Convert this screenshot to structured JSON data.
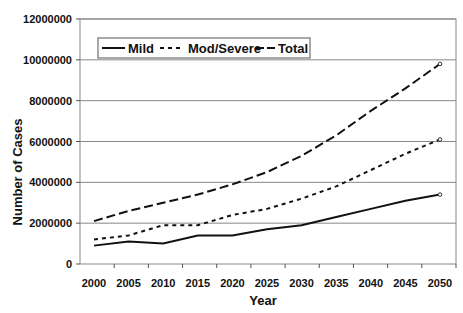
{
  "chart_data": {
    "type": "line",
    "title": "",
    "xlabel": "Year",
    "ylabel": "Number of Cases",
    "x": [
      2000,
      2005,
      2010,
      2015,
      2020,
      2025,
      2030,
      2035,
      2040,
      2045,
      2050
    ],
    "ylim": [
      0,
      12000000
    ],
    "yticks": [
      0,
      2000000,
      4000000,
      6000000,
      8000000,
      10000000,
      12000000
    ],
    "ytick_labels": [
      "0",
      "2000000",
      "4000000",
      "6000000",
      "8000000",
      "10000000",
      "12000000"
    ],
    "grid": true,
    "legend_position": "top-left inside",
    "series": [
      {
        "name": "Mild",
        "style": "solid",
        "values": [
          900000,
          1100000,
          1000000,
          1400000,
          1400000,
          1700000,
          1900000,
          2300000,
          2700000,
          3100000,
          3400000
        ]
      },
      {
        "name": "Mod/Severe",
        "style": "short-dash",
        "values": [
          1200000,
          1400000,
          1900000,
          1900000,
          2400000,
          2700000,
          3200000,
          3800000,
          4600000,
          5400000,
          6100000
        ]
      },
      {
        "name": "Total",
        "style": "long-dash",
        "values": [
          2100000,
          2600000,
          3000000,
          3400000,
          3900000,
          4500000,
          5300000,
          6300000,
          7500000,
          8600000,
          9800000
        ]
      }
    ]
  }
}
